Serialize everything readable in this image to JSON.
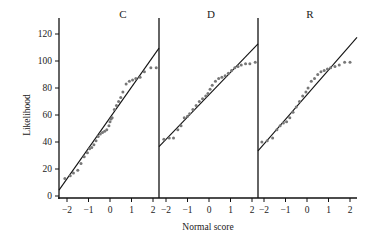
{
  "chart_data": {
    "type": "scatter",
    "title": "",
    "xlabel": "Normal score",
    "ylabel": "Likelihood",
    "ylim": [
      0,
      130
    ],
    "yticks": [
      0,
      20,
      40,
      60,
      80,
      100,
      120
    ],
    "xticks": [
      -2,
      -1,
      0,
      1,
      2
    ],
    "grid": false,
    "legend": "none",
    "panels": [
      {
        "label": "C",
        "fit_line": {
          "x": [
            -2.3,
            2.3
          ],
          "y": [
            6,
            110
          ]
        },
        "points": [
          [
            -2.1,
            13
          ],
          [
            -1.85,
            15
          ],
          [
            -1.7,
            17
          ],
          [
            -1.5,
            19
          ],
          [
            -1.35,
            24
          ],
          [
            -1.2,
            29
          ],
          [
            -1.05,
            32
          ],
          [
            -0.95,
            35
          ],
          [
            -0.85,
            36
          ],
          [
            -0.75,
            38
          ],
          [
            -0.65,
            41
          ],
          [
            -0.55,
            44
          ],
          [
            -0.45,
            46
          ],
          [
            -0.35,
            47
          ],
          [
            -0.25,
            48
          ],
          [
            -0.15,
            49
          ],
          [
            -0.05,
            52
          ],
          [
            0.0,
            55
          ],
          [
            0.05,
            57
          ],
          [
            0.1,
            58
          ],
          [
            0.2,
            64
          ],
          [
            0.3,
            67
          ],
          [
            0.4,
            70
          ],
          [
            0.5,
            73
          ],
          [
            0.6,
            77
          ],
          [
            0.75,
            83
          ],
          [
            0.9,
            85
          ],
          [
            1.05,
            86
          ],
          [
            1.2,
            87
          ],
          [
            1.4,
            88
          ],
          [
            1.6,
            92
          ],
          [
            1.9,
            95
          ],
          [
            2.15,
            95
          ]
        ]
      },
      {
        "label": "D",
        "fit_line": {
          "x": [
            -2.3,
            2.3
          ],
          "y": [
            37,
            113
          ]
        },
        "points": [
          [
            -2.1,
            42
          ],
          [
            -1.85,
            43
          ],
          [
            -1.65,
            43
          ],
          [
            -1.45,
            49
          ],
          [
            -1.3,
            52
          ],
          [
            -1.15,
            58
          ],
          [
            -1.0,
            59
          ],
          [
            -0.9,
            61
          ],
          [
            -0.75,
            64
          ],
          [
            -0.6,
            67
          ],
          [
            -0.45,
            70
          ],
          [
            -0.3,
            72
          ],
          [
            -0.15,
            74
          ],
          [
            -0.05,
            76
          ],
          [
            0.05,
            79
          ],
          [
            0.15,
            82
          ],
          [
            0.3,
            85
          ],
          [
            0.45,
            87
          ],
          [
            0.6,
            88
          ],
          [
            0.75,
            89
          ],
          [
            0.9,
            91
          ],
          [
            1.05,
            93
          ],
          [
            1.2,
            95
          ],
          [
            1.35,
            96
          ],
          [
            1.5,
            97
          ],
          [
            1.7,
            98
          ],
          [
            1.9,
            98
          ],
          [
            2.15,
            99
          ]
        ]
      },
      {
        "label": "R",
        "fit_line": {
          "x": [
            -2.3,
            2.3
          ],
          "y": [
            33,
            117
          ]
        },
        "points": [
          [
            -2.1,
            40
          ],
          [
            -1.85,
            41
          ],
          [
            -1.6,
            43
          ],
          [
            -1.4,
            49
          ],
          [
            -1.25,
            52
          ],
          [
            -1.1,
            54
          ],
          [
            -0.95,
            55
          ],
          [
            -0.8,
            58
          ],
          [
            -0.65,
            62
          ],
          [
            -0.5,
            66
          ],
          [
            -0.35,
            70
          ],
          [
            -0.2,
            74
          ],
          [
            -0.05,
            77
          ],
          [
            0.05,
            80
          ],
          [
            0.2,
            85
          ],
          [
            0.35,
            87
          ],
          [
            0.5,
            90
          ],
          [
            0.65,
            92
          ],
          [
            0.8,
            93
          ],
          [
            0.95,
            94
          ],
          [
            1.1,
            95
          ],
          [
            1.3,
            96
          ],
          [
            1.5,
            97
          ],
          [
            1.75,
            99
          ],
          [
            2.0,
            99
          ]
        ]
      }
    ]
  },
  "labels": {
    "ylabel": "Likelihood",
    "xlabel": "Normal score",
    "panel_c": "C",
    "panel_d": "D",
    "panel_r": "R"
  }
}
